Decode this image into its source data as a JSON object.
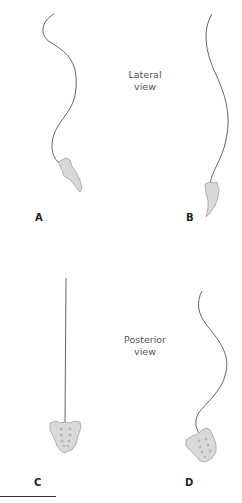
{
  "figure": {
    "views": [
      {
        "id": "lateral",
        "label_line1": "Lateral",
        "label_line2": "view"
      },
      {
        "id": "posterior",
        "label_line1": "Posterior",
        "label_line2": "view"
      }
    ],
    "panels": [
      {
        "id": "A",
        "label": "A",
        "view": "lateral",
        "description": "Lateral spinal curve with sacrum tilted"
      },
      {
        "id": "B",
        "label": "B",
        "view": "lateral",
        "description": "Lateral spinal curve, flatter, with sacrum"
      },
      {
        "id": "C",
        "label": "C",
        "view": "posterior",
        "description": "Straight vertical spine over level sacrum"
      },
      {
        "id": "D",
        "label": "D",
        "view": "posterior",
        "description": "Scoliotic S-curve over tilted sacrum"
      }
    ],
    "colors": {
      "line": "#555555",
      "sacrum_fill": "#d9d9d9",
      "sacrum_stroke": "#8a8a8a",
      "foramina": "#8a8a8a"
    }
  }
}
